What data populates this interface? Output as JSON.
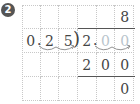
{
  "problem_number": "2",
  "division": {
    "divisor": "0.25",
    "dividend": "2.00",
    "quotient": "8",
    "rows": [
      [
        "",
        "",
        "",
        "",
        "",
        "8"
      ],
      [
        "0",
        "2",
        "5",
        "2",
        "0",
        "0"
      ],
      [
        "",
        "",
        "",
        "2",
        "0",
        "0"
      ],
      [
        "",
        "",
        "",
        "",
        "",
        "0"
      ]
    ]
  }
}
